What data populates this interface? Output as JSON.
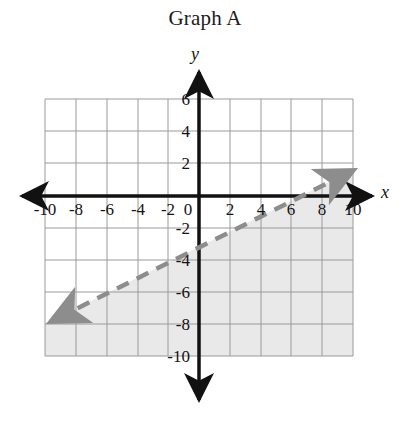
{
  "title": "Graph A",
  "axes": {
    "x_label": "x",
    "y_label": "y",
    "x_ticks": [
      "-10",
      "-8",
      "-6",
      "-4",
      "-2",
      "0",
      "2",
      "4",
      "6",
      "8",
      "10"
    ],
    "y_ticks": [
      "6",
      "4",
      "2",
      "-2",
      "-4",
      "-6",
      "-8",
      "-10"
    ]
  },
  "colors": {
    "background": "#ffffff",
    "axis": "#111111",
    "grid": "#9a9a9a",
    "line": "#8d8d8d",
    "shading": "#e9e9e9",
    "text": "#141414"
  },
  "chart_data": {
    "type": "line",
    "title": "Graph A",
    "xlabel": "x",
    "ylabel": "y",
    "xlim": [
      -10,
      10
    ],
    "ylim": [
      -10,
      6
    ],
    "xticks": [
      -10,
      -8,
      -6,
      -4,
      -2,
      0,
      2,
      4,
      6,
      8,
      10
    ],
    "yticks": [
      6,
      4,
      2,
      -2,
      -4,
      -6,
      -8,
      -10
    ],
    "grid": true,
    "legend": "none",
    "series": [
      {
        "name": "boundary-line",
        "style": "dashed",
        "arrows": "both",
        "slope": 0.5,
        "y_intercept": -3,
        "x_intercept": 6,
        "equation": "y = x/2 - 3",
        "x": [
          -10,
          10
        ],
        "y": [
          -8,
          2
        ]
      }
    ],
    "shaded_region": {
      "description": "region below the dashed boundary line",
      "inequality": "y < x/2 - 3",
      "fill": "#e9e9e9",
      "boundary_included": false
    }
  }
}
